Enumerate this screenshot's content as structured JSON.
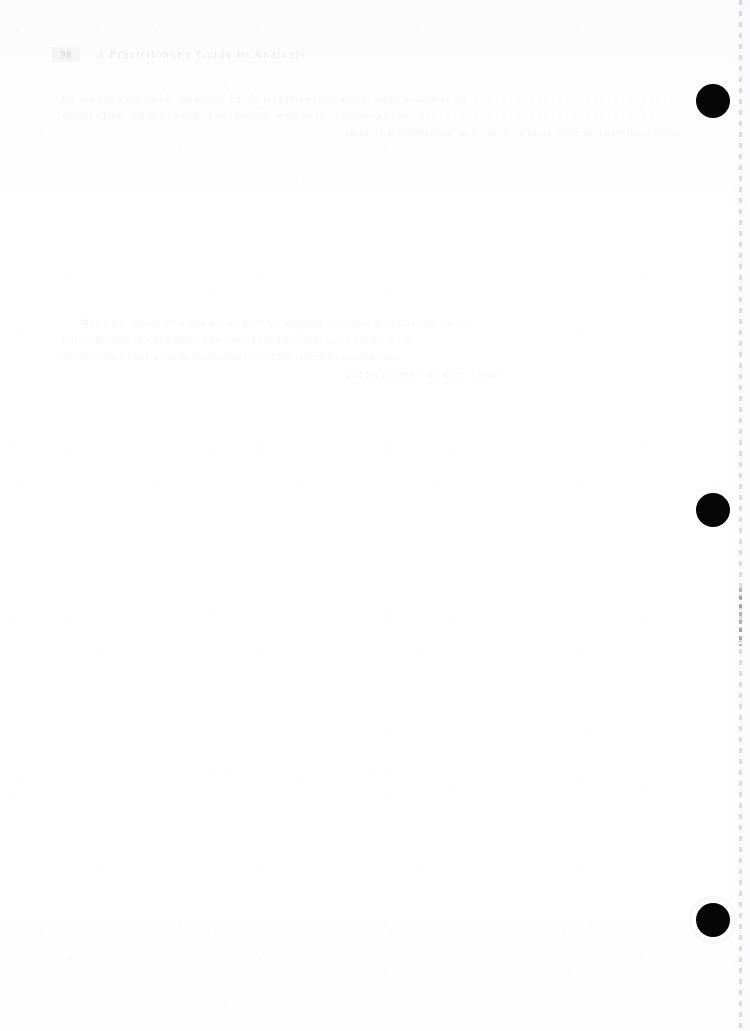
{
  "document": {
    "type": "scanned-page",
    "page_width": 750,
    "page_height": 1031,
    "background_color": "#ffffff",
    "ink_color": "#0a0a0a",
    "condition": "faded-ghost-print"
  },
  "header": {
    "page_number": "98",
    "running_head": "A Practitioner's Guide to Analysis"
  },
  "paragraphs": [
    {
      "id": "paragraph-one",
      "lines": [
        "the preceding discussion has shown that the resulting values remain consistent across the",
        "sample range, and that no further correction is required for the observed intervals.",
        "Additional commentary on this point appears in the appendix that follows."
      ]
    },
    {
      "id": "paragraph-two",
      "lines": [
        "Where the conditions above are not met, the alternate procedure should be applied in",
        "full, with particular attention given to the boundary cases noted earlier in this",
        "chapter, since these account for the majority of the reported discrepancies.",
        "See the summary table for details."
      ]
    }
  ],
  "margin_marks": {
    "label": "punch-hole-marks",
    "color": "#050505",
    "diameter_px": 34,
    "positions": [
      {
        "id": "punch-mark-1",
        "x": 713,
        "y": 101
      },
      {
        "id": "punch-mark-2",
        "x": 713,
        "y": 510
      },
      {
        "id": "punch-mark-3",
        "x": 713,
        "y": 920
      }
    ]
  },
  "scan_edge": {
    "label": "sheet-edge-seam",
    "x": 740,
    "style": "dashed",
    "color": "#60626c"
  },
  "blank_area": {
    "label": "blank-page-body",
    "note": ""
  }
}
